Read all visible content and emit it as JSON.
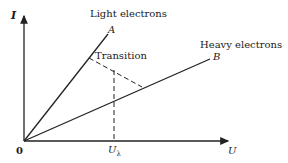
{
  "diagram": {
    "axes": {
      "y_label": "I",
      "x_label": "U",
      "origin_label": "0",
      "x_tick_label": "U",
      "x_tick_subscript": "λ"
    },
    "lines": [
      {
        "id": "A",
        "label": "A",
        "caption": "Light electrons"
      },
      {
        "id": "B",
        "label": "B",
        "caption": "Heavy electrons"
      }
    ],
    "transition_label": "Transition",
    "colors": {
      "line": "#222222",
      "background": "#ffffff"
    }
  }
}
